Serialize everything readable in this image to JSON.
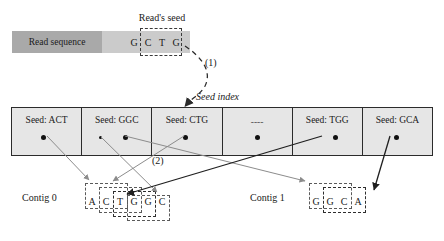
{
  "figure": {
    "read": {
      "label": "Read sequence",
      "visible_bases": [
        "G",
        "C",
        "T",
        "G"
      ],
      "seed_label": "Read's seed",
      "seed": "CTG"
    },
    "steps": {
      "one": "(1)",
      "two": "(2)"
    },
    "seed_index": {
      "title": "Seed index",
      "cells": [
        {
          "label": "Seed: ACT",
          "seed": "ACT",
          "dots": 1
        },
        {
          "label": "Seed: GGC",
          "seed": "GGC",
          "dots": 2
        },
        {
          "label": "Seed: CTG",
          "seed": "CTG",
          "dots": 1
        },
        {
          "label": "----",
          "seed": "",
          "dots": 1
        },
        {
          "label": "Seed: TGG",
          "seed": "TGG",
          "dots": 1
        },
        {
          "label": "Seed: GCA",
          "seed": "GCA",
          "dots": 1
        }
      ]
    },
    "contigs": [
      {
        "label": "Contig 0",
        "bases": [
          "A",
          "C",
          "T",
          "G",
          "G",
          "C"
        ]
      },
      {
        "label": "Contig 1",
        "bases": [
          "G",
          "G",
          "C",
          "A"
        ]
      }
    ]
  },
  "colors": {
    "read_bar_dark": "#a9a9a9",
    "read_bar_light": "#cbcbcb",
    "seed_index_fill": "#e6e6e6",
    "border": "#2b2b2b",
    "connector_light": "#8c8c8c",
    "connector_dark": "#1f1f1f"
  }
}
